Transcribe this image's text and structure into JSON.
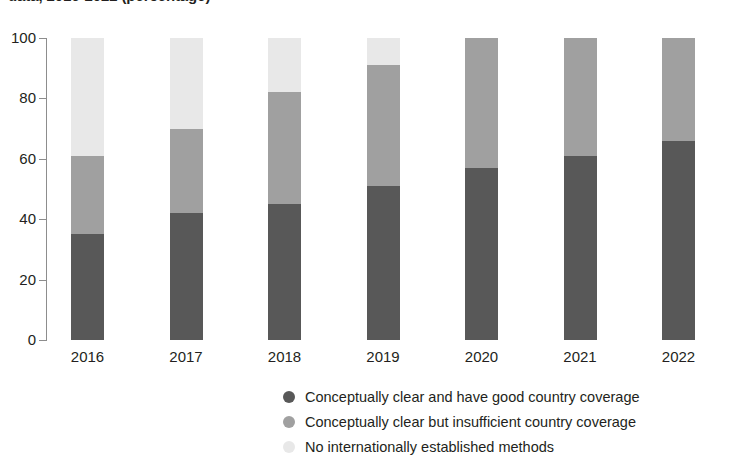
{
  "chart_data": {
    "type": "bar",
    "subtype": "stacked-bar-100",
    "title": "data, 2016-2022 (percentage)",
    "xlabel": "",
    "ylabel": "",
    "ylim": [
      0,
      100
    ],
    "yticks": [
      0,
      20,
      40,
      60,
      80,
      100
    ],
    "ytick_labels": [
      "0",
      "20",
      "40",
      "60",
      "80",
      "100"
    ],
    "grid": false,
    "legend_position": "bottom",
    "categories": [
      "2016",
      "2017",
      "2018",
      "2019",
      "2020",
      "2021",
      "2022"
    ],
    "series": [
      {
        "name": "Conceptually clear and have good country coverage",
        "color": "#585858",
        "values": [
          35,
          42,
          45,
          51,
          57,
          61,
          66
        ]
      },
      {
        "name": "Conceptually clear but insufficient country coverage",
        "color": "#a0a0a0",
        "values": [
          26,
          28,
          37,
          40,
          43,
          39,
          34
        ]
      },
      {
        "name": "No internationally established methods",
        "color": "#e8e8e8",
        "values": [
          39,
          30,
          18,
          9,
          0,
          0,
          0
        ]
      }
    ],
    "cumulative_tops": [
      {
        "category": "2016",
        "good": 35,
        "good_plus_insufficient": 61,
        "total": 100
      },
      {
        "category": "2017",
        "good": 42,
        "good_plus_insufficient": 70,
        "total": 100
      },
      {
        "category": "2018",
        "good": 45,
        "good_plus_insufficient": 82,
        "total": 100
      },
      {
        "category": "2019",
        "good": 51,
        "good_plus_insufficient": 91,
        "total": 100
      },
      {
        "category": "2020",
        "good": 57,
        "good_plus_insufficient": 100,
        "total": 100
      },
      {
        "category": "2021",
        "good": 61,
        "good_plus_insufficient": 100,
        "total": 100
      },
      {
        "category": "2022",
        "good": 66,
        "good_plus_insufficient": 100,
        "total": 100
      }
    ]
  },
  "colors": {
    "good": "#585858",
    "insufficient": "#a0a0a0",
    "none": "#e8e8e8",
    "axis": "#8d8d8d",
    "text": "#231f20",
    "background": "#ffffff"
  },
  "legend": {
    "items": [
      {
        "label": "Conceptually clear and have good country coverage",
        "color": "#585858"
      },
      {
        "label": "Conceptually clear but insufficient country coverage",
        "color": "#a0a0a0"
      },
      {
        "label": "No internationally established methods",
        "color": "#e8e8e8"
      }
    ]
  }
}
